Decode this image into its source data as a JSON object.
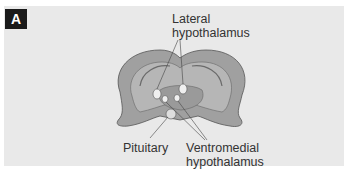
{
  "panel": {
    "badge": "A",
    "background": "#e9e9e9"
  },
  "labels": {
    "lateral_line1": "Lateral",
    "lateral_line2": "hypothalamus",
    "pituitary": "Pituitary",
    "ventromedial_line1": "Ventromedial",
    "ventromedial_line2": "hypothalamus"
  },
  "colors": {
    "brain_fill": "#a8a8a8",
    "brain_dark": "#8c8c8c",
    "nucleus_fill": "#efefef"
  }
}
